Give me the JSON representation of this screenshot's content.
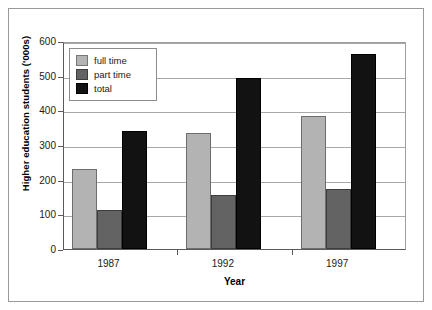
{
  "chart_data": {
    "type": "bar",
    "title": "",
    "subtitle": "",
    "xlabel": "Year",
    "ylabel": "Higher education students ('000s)",
    "categories": [
      "1987",
      "1992",
      "1997"
    ],
    "series": [
      {
        "name": "full time",
        "color": "#b3b3b3",
        "values": [
          230,
          334,
          383
        ]
      },
      {
        "name": "part time",
        "color": "#636363",
        "values": [
          113,
          155,
          172
        ]
      },
      {
        "name": "total",
        "color": "#121212",
        "values": [
          341,
          493,
          562
        ]
      }
    ],
    "ylim": [
      0,
      600
    ],
    "ytick_values": [
      0,
      100,
      200,
      300,
      400,
      500,
      600
    ],
    "ytick_labels": [
      "0",
      "100",
      "200",
      "300",
      "400",
      "500",
      "600"
    ],
    "grid": true,
    "grid_axis": "y",
    "legend_position": "upper left",
    "legend_entries": [
      "full time",
      "part time",
      "total"
    ]
  },
  "axes": {
    "y_label": "Higher education students ('000s)",
    "x_label": "Year",
    "y_ticks": [
      {
        "value": 600,
        "label": "600"
      },
      {
        "value": 500,
        "label": "500"
      },
      {
        "value": 400,
        "label": "400"
      },
      {
        "value": 300,
        "label": "300"
      },
      {
        "value": 200,
        "label": "200"
      },
      {
        "value": 100,
        "label": "100"
      },
      {
        "value": 0,
        "label": "0"
      }
    ],
    "x_ticks": [
      {
        "label": "1987"
      },
      {
        "label": "1992"
      },
      {
        "label": "1997"
      }
    ]
  },
  "legend": {
    "items": [
      {
        "label": "full time",
        "color": "#b3b3b3"
      },
      {
        "label": "part time",
        "color": "#636363"
      },
      {
        "label": "total",
        "color": "#121212"
      }
    ]
  },
  "bars": [
    {
      "group": "1987",
      "series": "full time",
      "value": 230
    },
    {
      "group": "1987",
      "series": "part time",
      "value": 113
    },
    {
      "group": "1987",
      "series": "total",
      "value": 341
    },
    {
      "group": "1992",
      "series": "full time",
      "value": 334
    },
    {
      "group": "1992",
      "series": "part time",
      "value": 155
    },
    {
      "group": "1992",
      "series": "total",
      "value": 493
    },
    {
      "group": "1997",
      "series": "full time",
      "value": 383
    },
    {
      "group": "1997",
      "series": "part time",
      "value": 172
    },
    {
      "group": "1997",
      "series": "total",
      "value": 562
    }
  ]
}
